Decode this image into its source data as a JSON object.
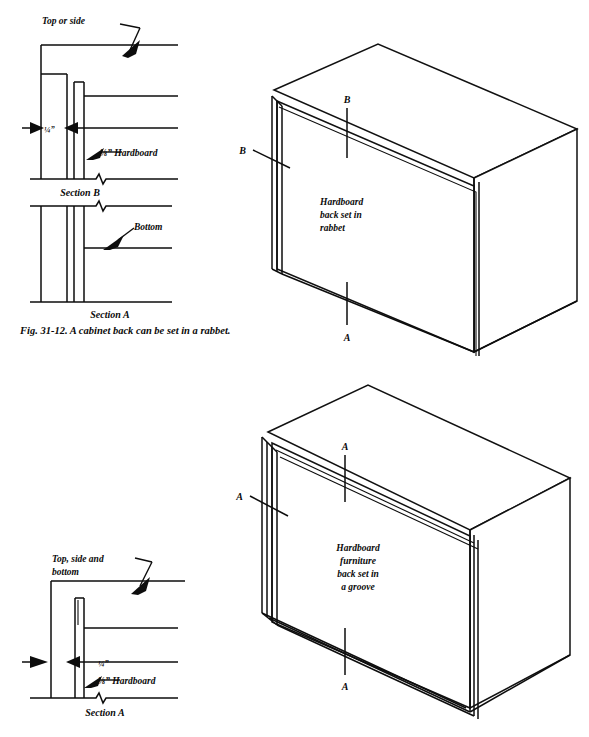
{
  "figure": {
    "caption": "Fig. 31-12. A cabinet back can be set in a rabbet.",
    "page_background": "#ffffff",
    "ink_color": "#0d0d0d"
  },
  "section_detail_top": {
    "name": "rabbet-section-detail",
    "labels": {
      "top_or_side": "Top or side",
      "dimension_quarter": "¼”",
      "hardboard_note": "⅛”  Hardboard",
      "section_b": "Section B",
      "bottom": "Bottom",
      "section_a": "Section A"
    }
  },
  "section_detail_bottom": {
    "name": "groove-section-detail",
    "labels": {
      "top_side_and_line1": "Top, side and",
      "top_side_and_line2": "bottom",
      "dimension_quarter": "¼”",
      "hardboard_note": "⅛”  Hardboard",
      "section_a": "Section A"
    }
  },
  "cabinet_top": {
    "name": "cabinet-rabbet-isometric",
    "body_text": [
      "Hardboard",
      "back set in",
      "rabbet"
    ],
    "section_marks": {
      "upper_letter": "B",
      "left_letter": "B",
      "lower_letter": "A"
    }
  },
  "cabinet_bottom": {
    "name": "cabinet-groove-isometric",
    "body_text": [
      "Hardboard",
      "furniture",
      "back set in",
      "a groove"
    ],
    "section_marks": {
      "upper_letter": "A",
      "left_letter": "A",
      "lower_letter": "A"
    }
  }
}
